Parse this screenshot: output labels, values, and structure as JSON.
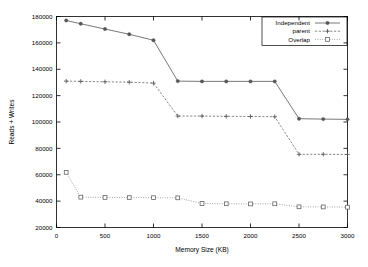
{
  "chart_data": {
    "type": "line",
    "title": "",
    "xlabel": "Memory Size (KB)",
    "ylabel": "Reads + Writes",
    "xlim": [
      0,
      3000
    ],
    "ylim": [
      20000,
      180000
    ],
    "xticks": [
      "0",
      "500",
      "1000",
      "1500",
      "2000",
      "2500",
      "3000"
    ],
    "xtick_values": [
      0,
      500,
      1000,
      1500,
      2000,
      2500,
      3000
    ],
    "yticks": [
      "20000",
      "40000",
      "60000",
      "80000",
      "100000",
      "120000",
      "140000",
      "160000",
      "180000"
    ],
    "ytick_values": [
      20000,
      40000,
      60000,
      80000,
      100000,
      120000,
      140000,
      160000,
      180000
    ],
    "grid": false,
    "legend_position": "top-right",
    "series": [
      {
        "name": "Independent",
        "marker": "filled-circle",
        "linestyle": "solid",
        "color": "#606060",
        "x": [
          100,
          250,
          500,
          750,
          1000,
          1250,
          1500,
          1750,
          2000,
          2250,
          2500,
          2750,
          3000
        ],
        "values": [
          177000,
          174500,
          170500,
          166500,
          162000,
          131000,
          130800,
          130800,
          130800,
          130800,
          102500,
          102200,
          102000
        ]
      },
      {
        "name": "parent",
        "marker": "plus",
        "linestyle": "dashed",
        "color": "#707070",
        "x": [
          100,
          250,
          500,
          750,
          1000,
          1250,
          1500,
          1750,
          2000,
          2250,
          2500,
          2750,
          3000
        ],
        "values": [
          131000,
          130800,
          130500,
          130200,
          129500,
          104500,
          104500,
          104300,
          104200,
          104000,
          75500,
          75500,
          75400
        ]
      },
      {
        "name": "Overlap",
        "marker": "open-square",
        "linestyle": "dotted",
        "color": "#8a8a8a",
        "x": [
          100,
          250,
          500,
          750,
          1000,
          1250,
          1500,
          1750,
          2000,
          2250,
          2500,
          2750,
          3000
        ],
        "values": [
          61800,
          43000,
          42800,
          42700,
          42600,
          42500,
          38200,
          38000,
          37900,
          38000,
          35700,
          35600,
          35400
        ]
      }
    ]
  },
  "legend": {
    "entries": [
      {
        "label": "Independent"
      },
      {
        "label": "parent"
      },
      {
        "label": "Overlap"
      }
    ]
  }
}
